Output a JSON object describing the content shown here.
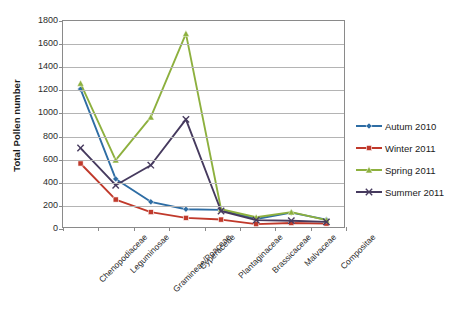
{
  "chart_data": {
    "type": "line",
    "title": "",
    "xlabel": "",
    "ylabel": "Total Pollen number",
    "ylim": [
      0,
      1800
    ],
    "ytick_step": 200,
    "yticks": [
      0,
      200,
      400,
      600,
      800,
      1000,
      1200,
      1400,
      1600,
      1800
    ],
    "grid": "horizontal",
    "legend_position": "right",
    "categories": [
      "Chenopodiaceae",
      "Leguminosae",
      "Gramineae/Poaceae",
      "Cyperaceae",
      "Plantaginaceae",
      "Brassicaceae",
      "Malvaceae",
      "Compositae"
    ],
    "series": [
      {
        "name": "Autum 2010",
        "color": "#2E6DA4",
        "marker": "diamond",
        "values": [
          1205,
          420,
          220,
          155,
          150,
          70,
          125,
          65
        ]
      },
      {
        "name": "Winter 2011",
        "color": "#C0392B",
        "marker": "square",
        "values": [
          555,
          240,
          130,
          80,
          65,
          25,
          35,
          30
        ]
      },
      {
        "name": "Spring 2011",
        "color": "#8DB03E",
        "marker": "triangle",
        "values": [
          1255,
          585,
          960,
          1690,
          155,
          85,
          130,
          60
        ]
      },
      {
        "name": "Summer 2011",
        "color": "#463A5E",
        "marker": "x",
        "values": [
          690,
          365,
          540,
          940,
          140,
          60,
          55,
          45
        ]
      }
    ]
  }
}
